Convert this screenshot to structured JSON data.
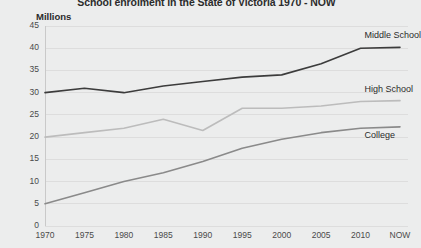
{
  "chart": {
    "title": "School enrolment in the State of Victoria 1970 - NOW",
    "y_axis_title": "Millions"
  },
  "chart_data": {
    "type": "line",
    "title": "School enrolment in the State of Victoria 1970 - NOW",
    "xlabel": "",
    "ylabel": "Millions",
    "ylim": [
      0,
      45
    ],
    "yticks": [
      0,
      5,
      10,
      15,
      20,
      25,
      30,
      35,
      40,
      45
    ],
    "ytick_labels": [
      "0",
      "5",
      "10",
      "15",
      "20",
      "25",
      "30",
      "35",
      "40",
      "45"
    ],
    "categories": [
      "1970",
      "1975",
      "1980",
      "1985",
      "1990",
      "1995",
      "2000",
      "2005",
      "2010",
      "NOW"
    ],
    "grid": true,
    "legend_position": "inline-right",
    "series": [
      {
        "name": "Middle School",
        "color": "#3c3c3c",
        "values": [
          30,
          31,
          30,
          31.5,
          32.5,
          33.5,
          34,
          36.5,
          40,
          40.2
        ]
      },
      {
        "name": "High School",
        "color": "#bcbcbc",
        "values": [
          20,
          21,
          22,
          24,
          21.5,
          26.5,
          26.5,
          27,
          28,
          28.2
        ]
      },
      {
        "name": "College",
        "color": "#8a8a8a",
        "values": [
          5,
          7.5,
          10,
          12,
          14.5,
          17.5,
          19.5,
          21,
          22,
          22.3
        ]
      }
    ]
  },
  "series_labels": {
    "middle_school": "Middle School",
    "high_school": "High School",
    "college": "College"
  }
}
